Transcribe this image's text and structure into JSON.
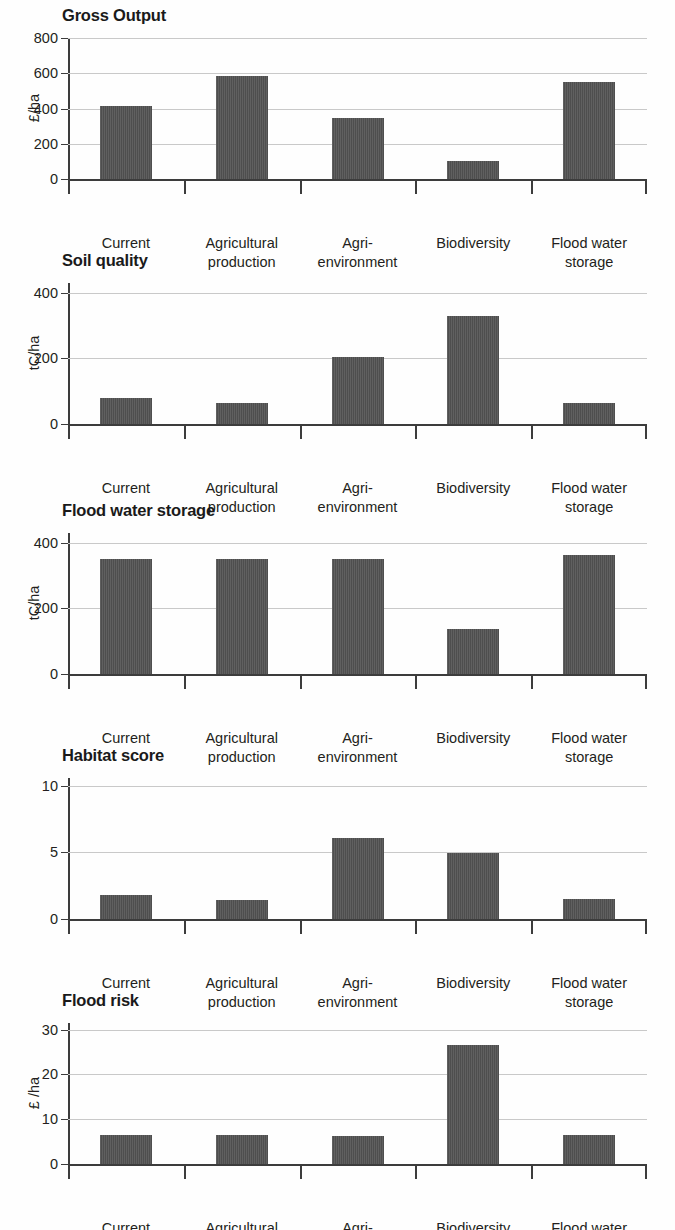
{
  "figure": {
    "categories": [
      "Current",
      "Agricultural\nproduction",
      "Agri-\nenvironment",
      "Biodiversity",
      "Flood water\nstorage"
    ],
    "bar_color": "#4e4e4e",
    "gridline_color": "#c9c9c9",
    "axis_color": "#3c3c3c"
  },
  "chart_data": [
    {
      "type": "bar",
      "title": "Gross Output",
      "xlabel": "",
      "ylabel": "£/ha",
      "categories": [
        "Current",
        "Agricultural production",
        "Agri-environment",
        "Biodiversity",
        "Flood water storage"
      ],
      "values": [
        413,
        583,
        348,
        103,
        548
      ],
      "ylim": [
        0,
        800
      ],
      "yticks": [
        0,
        200,
        400,
        600,
        800
      ],
      "ytick_labels": [
        "0",
        "200",
        "400",
        "600",
        "800"
      ],
      "grid": true,
      "legend": "none"
    },
    {
      "type": "bar",
      "title": "Soil quality",
      "xlabel": "",
      "ylabel": "tC/ha",
      "categories": [
        "Current",
        "Agricultural production",
        "Agri-environment",
        "Biodiversity",
        "Flood water storage"
      ],
      "values": [
        80,
        65,
        203,
        328,
        63
      ],
      "ylim": [
        0,
        430
      ],
      "yticks": [
        0,
        200,
        400
      ],
      "ytick_labels": [
        "0",
        "200",
        "400"
      ],
      "grid": true,
      "legend": "none"
    },
    {
      "type": "bar",
      "title": "Flood water storage",
      "xlabel": "",
      "ylabel": "tC/ha",
      "categories": [
        "Current",
        "Agricultural production",
        "Agri-environment",
        "Biodiversity",
        "Flood water storage"
      ],
      "values": [
        351,
        351,
        351,
        137,
        363
      ],
      "ylim": [
        0,
        430
      ],
      "yticks": [
        0,
        200,
        400
      ],
      "ytick_labels": [
        "0",
        "200",
        "400"
      ],
      "grid": true,
      "legend": "none"
    },
    {
      "type": "bar",
      "title": "Habitat score",
      "xlabel": "",
      "ylabel": "",
      "categories": [
        "Current",
        "Agricultural production",
        "Agri-environment",
        "Biodiversity",
        "Flood water storage"
      ],
      "values": [
        1.8,
        1.4,
        6.1,
        5.0,
        1.5
      ],
      "ylim": [
        0,
        10.6
      ],
      "yticks": [
        0,
        5,
        10
      ],
      "ytick_labels": [
        "0",
        "5",
        "10"
      ],
      "grid": true,
      "legend": "none"
    },
    {
      "type": "bar",
      "title": "Flood risk",
      "xlabel": "",
      "ylabel": "£ /ha",
      "categories": [
        "Current",
        "Agricultural production",
        "Agri-environment",
        "Biodiversity",
        "Flood water storage"
      ],
      "values": [
        6.5,
        6.5,
        6.3,
        26.7,
        6.5
      ],
      "ylim": [
        0,
        31.5
      ],
      "yticks": [
        0,
        10,
        20,
        30
      ],
      "ytick_labels": [
        "0",
        "10",
        "20",
        "30"
      ],
      "grid": true,
      "legend": "none"
    }
  ]
}
